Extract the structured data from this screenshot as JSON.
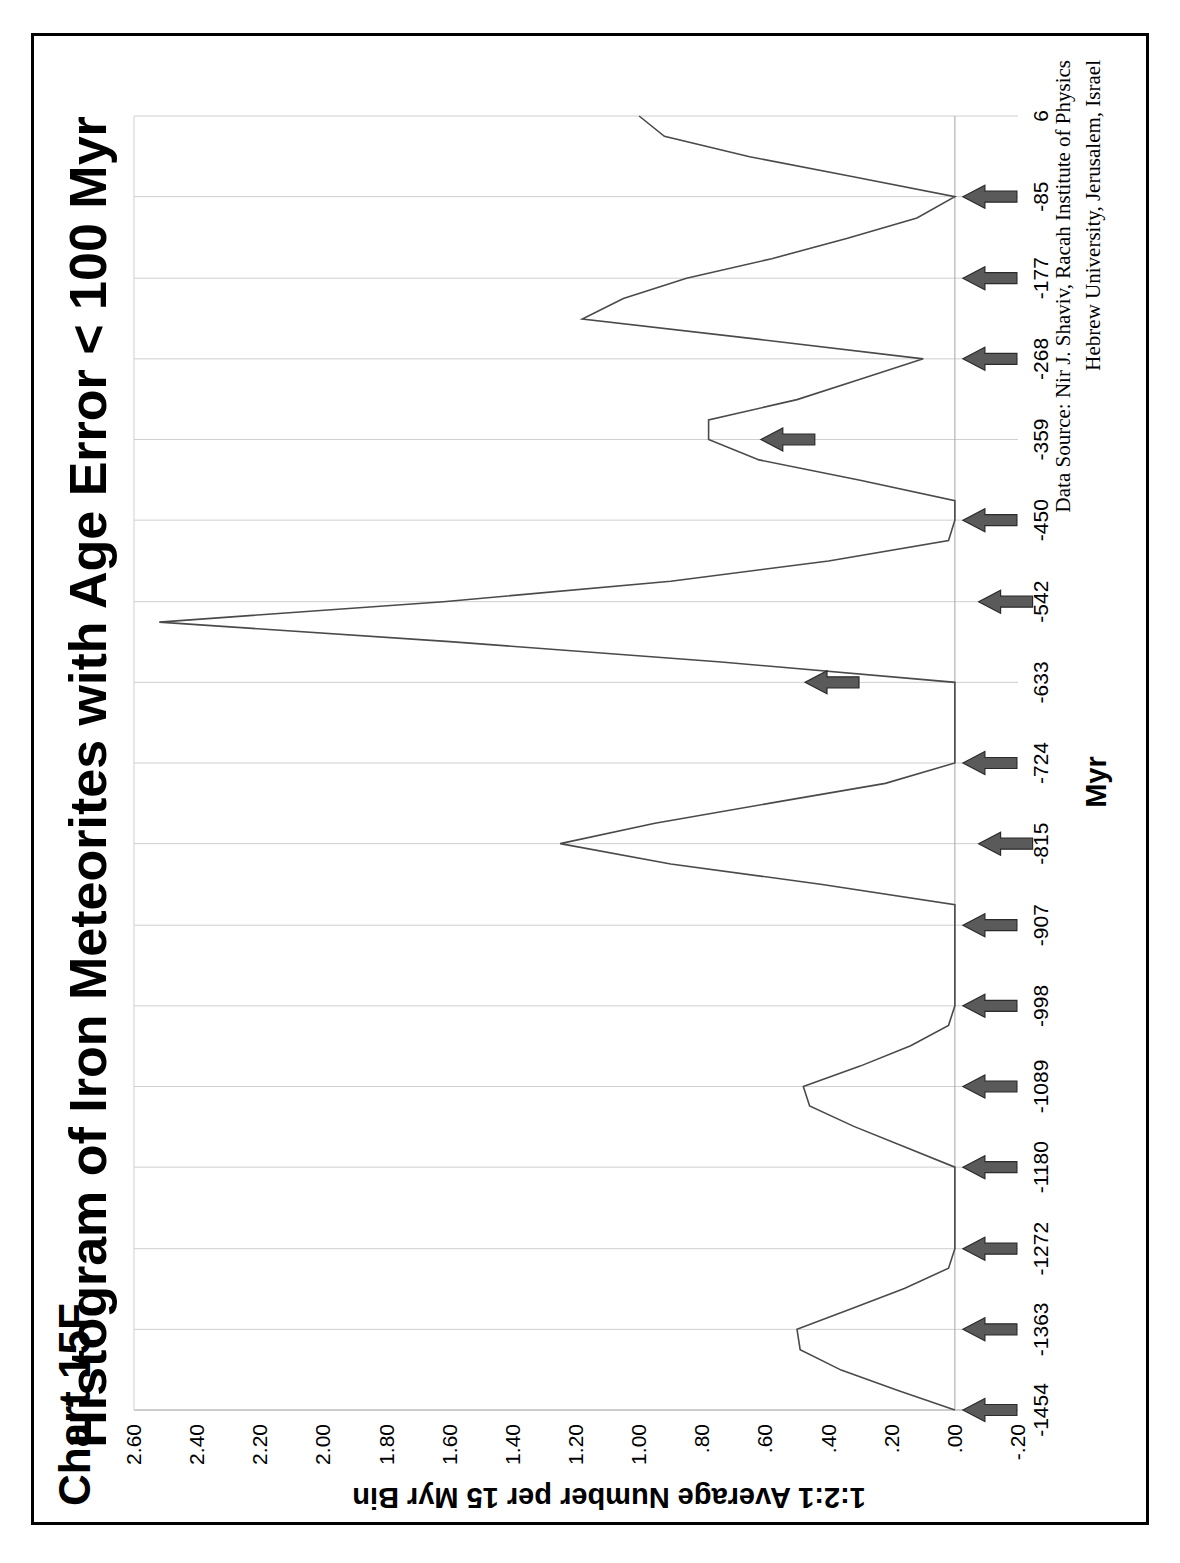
{
  "figure": {
    "chart_label": "Chart 15F",
    "title": "Histogram of Iron Meteorites with Age Error < 100 Myr",
    "source_line_1": "Data Source: Nir J. Shaviv, Racah Institute of Physics",
    "source_line_2": "Hebrew University, Jerusalem, Israel",
    "orientation_note": "rotated-90-ccw",
    "colors": {
      "line": "#4a4a4a",
      "grid": "#cfcfcf",
      "arrow_fill": "#5a5a5a",
      "arrow_stroke": "#2b2b2b",
      "frame": "#000000",
      "background": "#ffffff"
    }
  },
  "chart_data": {
    "type": "line",
    "title": "Histogram of Iron Meteorites with Age Error < 100 Myr",
    "subtitle": "Chart 15F",
    "xlabel": "Myr",
    "ylabel": "1:2:1 Average Number per 15 Myr Bin",
    "xlim": [
      -1500,
      6
    ],
    "ylim": [
      -0.2,
      2.6
    ],
    "grid": true,
    "legend": "none",
    "x_tick_labels": [
      "-1454",
      "-1363",
      "-1272",
      "-1180",
      "-1089",
      "-998",
      "-907",
      "-815",
      "-724",
      "-633",
      "-542",
      "-450",
      "-359",
      "-268",
      "-177",
      "-85",
      "6"
    ],
    "x_tick_values": [
      -1454,
      -1363,
      -1272,
      -1180,
      -1089,
      -998,
      -907,
      -815,
      -724,
      -633,
      -542,
      -450,
      -359,
      -268,
      -177,
      -85,
      6
    ],
    "y_tick_labels": [
      "-.20",
      ".00",
      ".20",
      ".40",
      ".60",
      ".80",
      "1.00",
      "1.20",
      "1.40",
      "1.60",
      "1.80",
      "2.00",
      "2.20",
      "2.40",
      "2.60"
    ],
    "y_tick_values": [
      -0.2,
      0.0,
      0.2,
      0.4,
      0.6,
      0.8,
      1.0,
      1.2,
      1.4,
      1.6,
      1.8,
      2.0,
      2.2,
      2.4,
      2.6
    ],
    "series": [
      {
        "name": "1:2:1 Average Number per 15 Myr Bin",
        "x": [
          -1454,
          -1432,
          -1409,
          -1386,
          -1363,
          -1340,
          -1317,
          -1294,
          -1272,
          -1249,
          -1226,
          -1203,
          -1180,
          -1157,
          -1134,
          -1111,
          -1089,
          -1066,
          -1043,
          -1020,
          -998,
          -975,
          -952,
          -929,
          -907,
          -884,
          -861,
          -838,
          -815,
          -792,
          -769,
          -747,
          -724,
          -701,
          -678,
          -656,
          -633,
          -610,
          -587,
          -565,
          -542,
          -519,
          -496,
          -473,
          -450,
          -428,
          -405,
          -382,
          -359,
          -337,
          -314,
          -291,
          -268,
          -246,
          -223,
          -200,
          -177,
          -155,
          -132,
          -109,
          -85,
          -62,
          -40,
          -17,
          6
        ],
        "values": [
          0.0,
          0.18,
          0.36,
          0.49,
          0.5,
          0.33,
          0.16,
          0.02,
          0.0,
          0.0,
          0.0,
          0.0,
          0.0,
          0.16,
          0.32,
          0.46,
          0.48,
          0.3,
          0.14,
          0.02,
          0.0,
          0.0,
          0.0,
          0.0,
          0.0,
          0.0,
          0.42,
          0.9,
          1.25,
          0.95,
          0.58,
          0.22,
          0.0,
          0.0,
          0.0,
          0.0,
          0.0,
          0.74,
          1.6,
          2.52,
          1.62,
          0.9,
          0.4,
          0.02,
          0.0,
          0.0,
          0.3,
          0.62,
          0.78,
          0.78,
          0.5,
          0.3,
          0.1,
          0.62,
          1.18,
          1.05,
          0.85,
          0.58,
          0.34,
          0.12,
          0.0,
          0.33,
          0.65,
          0.92,
          1.0
        ],
        "description": "Iron meteorite age histogram smoothed with 1:2:1 weighting, 15 Myr bins"
      }
    ],
    "annotations": {
      "kind": "arrow-markers",
      "description": "Filled arrow markers pointing at peaks / cluster positions along the time axis",
      "arrows_on_axis_myr": [
        -1454,
        -1363,
        -1272,
        -1180,
        -1089,
        -998,
        -907,
        -724,
        -450,
        -268,
        -177,
        -85
      ],
      "arrows_interior": [
        {
          "x_myr": -815,
          "y_value": -0.05
        },
        {
          "x_myr": -633,
          "y_value": 0.5
        },
        {
          "x_myr": -542,
          "y_value": -0.05
        },
        {
          "x_myr": -359,
          "y_value": 0.64
        }
      ]
    }
  }
}
